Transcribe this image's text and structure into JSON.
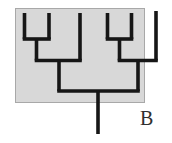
{
  "figure": {
    "panel_label": "B",
    "label_color": "#2f2f2f",
    "background_color": "#ffffff",
    "box": {
      "x": 15,
      "y": 8,
      "width": 130,
      "height": 95,
      "fill": "#d8d8d8",
      "border_color": "#a8a8a8"
    },
    "line_color": "#161616",
    "line_width": 3.6
  },
  "chart_data": {
    "type": "cladogram",
    "orientation": "root-at-bottom",
    "tip_count": 6,
    "topology": "(((1,2),3),((4,5),6))",
    "tips_x": [
      24.5,
      49,
      80,
      107.5,
      131.5,
      156
    ],
    "node_depths_y": {
      "tips_top": 13,
      "rightmost_tip_top": 11,
      "cherry_joins": 39,
      "clade_joins": 60.5,
      "root_join": 91,
      "root_stem_bottom": 134
    },
    "segments": [
      {
        "name": "tip-1",
        "x1": 24.5,
        "y1": 13,
        "x2": 24.5,
        "y2": 39
      },
      {
        "name": "tip-2",
        "x1": 49,
        "y1": 13,
        "x2": 49,
        "y2": 39
      },
      {
        "name": "cherry-12-bar",
        "x1": 22.7,
        "y1": 39,
        "x2": 50.8,
        "y2": 39
      },
      {
        "name": "cherry-12-stem",
        "x1": 36.5,
        "y1": 39,
        "x2": 36.5,
        "y2": 60.5
      },
      {
        "name": "tip-3",
        "x1": 80,
        "y1": 13,
        "x2": 80,
        "y2": 60.5
      },
      {
        "name": "left-clade-bar",
        "x1": 34.7,
        "y1": 60.5,
        "x2": 81.8,
        "y2": 60.5
      },
      {
        "name": "left-clade-stem",
        "x1": 59,
        "y1": 60.5,
        "x2": 59,
        "y2": 91
      },
      {
        "name": "tip-4",
        "x1": 107.5,
        "y1": 13,
        "x2": 107.5,
        "y2": 39
      },
      {
        "name": "tip-5",
        "x1": 131.5,
        "y1": 13,
        "x2": 131.5,
        "y2": 39
      },
      {
        "name": "cherry-45-bar",
        "x1": 105.7,
        "y1": 39,
        "x2": 133.3,
        "y2": 39
      },
      {
        "name": "cherry-45-stem",
        "x1": 119.5,
        "y1": 39,
        "x2": 119.5,
        "y2": 60.5
      },
      {
        "name": "tip-6",
        "x1": 156,
        "y1": 11,
        "x2": 156,
        "y2": 60.5
      },
      {
        "name": "right-clade-bar",
        "x1": 117.7,
        "y1": 60.5,
        "x2": 157.8,
        "y2": 60.5
      },
      {
        "name": "right-clade-stem",
        "x1": 138,
        "y1": 60.5,
        "x2": 138,
        "y2": 91
      },
      {
        "name": "root-bar",
        "x1": 57.2,
        "y1": 91,
        "x2": 139.8,
        "y2": 91
      },
      {
        "name": "root-stem",
        "x1": 98,
        "y1": 91,
        "x2": 98,
        "y2": 134
      }
    ]
  }
}
